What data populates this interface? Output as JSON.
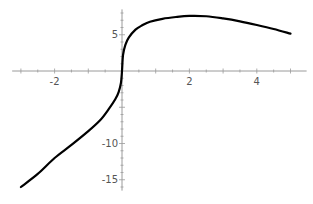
{
  "chart_data": {
    "type": "line",
    "title": "",
    "xlabel": "",
    "ylabel": "",
    "xlim": [
      -3.2,
      5.3
    ],
    "ylim": [
      -16.5,
      8.5
    ],
    "grid": false,
    "x_ticks": [
      {
        "value": -2,
        "label": "-2"
      },
      {
        "value": 2,
        "label": "2"
      },
      {
        "value": 4,
        "label": "4"
      }
    ],
    "y_ticks": [
      {
        "value": 5,
        "label": "5"
      },
      {
        "value": -10,
        "label": "-10"
      },
      {
        "value": -15,
        "label": "-15"
      }
    ],
    "x_minor_step": 0.5,
    "y_minor_step": 1,
    "series": [
      {
        "name": "f(x)",
        "color": "#000000",
        "x": [
          -3.0,
          -2.5,
          -2.0,
          -1.5,
          -1.0,
          -0.65,
          -0.4,
          -0.2,
          -0.1,
          -0.03,
          0.0,
          0.03,
          0.1,
          0.2,
          0.4,
          0.6,
          0.83,
          1.2,
          1.6,
          2.0,
          2.5,
          3.0,
          3.5,
          4.0,
          4.5,
          5.0
        ],
        "y": [
          -16.0,
          -14.2,
          -12.0,
          -10.2,
          -8.3,
          -6.8,
          -5.3,
          -3.9,
          -2.9,
          -1.6,
          0.0,
          2.2,
          3.6,
          4.6,
          5.7,
          6.3,
          6.8,
          7.2,
          7.45,
          7.6,
          7.55,
          7.25,
          6.85,
          6.35,
          5.8,
          5.15
        ]
      }
    ]
  }
}
